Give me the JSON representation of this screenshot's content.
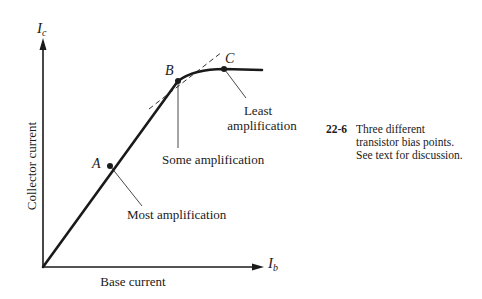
{
  "figure": {
    "number": "22-6",
    "caption": "Three different transistor bias points. See text for discussion.",
    "caption_lines": [
      "Three different",
      "transistor bias points.",
      "See text for discussion."
    ]
  },
  "axes": {
    "y_symbol": "I",
    "y_subscript": "c",
    "y_label": "Collector current",
    "x_symbol": "I",
    "x_subscript": "b",
    "x_label": "Base current"
  },
  "points": [
    {
      "id": "A",
      "label": "A",
      "annotation": "Most amplification"
    },
    {
      "id": "B",
      "label": "B",
      "annotation": "Some amplification"
    },
    {
      "id": "C",
      "label": "C",
      "annotation_line1": "Least",
      "annotation_line2": "amplification"
    }
  ],
  "colors": {
    "ink": "#1a1a1a",
    "background": "#ffffff"
  }
}
